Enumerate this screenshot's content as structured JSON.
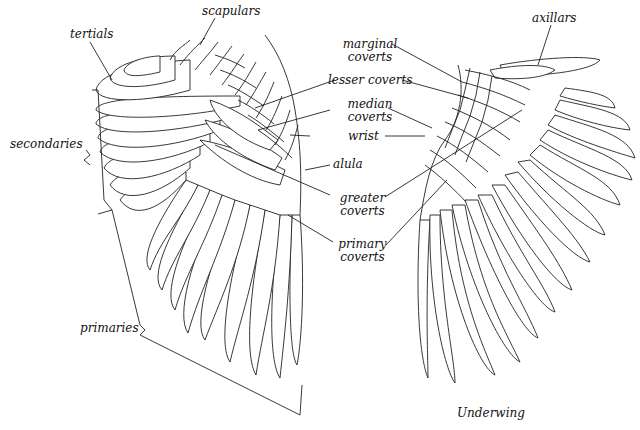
{
  "diagram": {
    "type": "labeled wing anatomy illustration",
    "views": [
      {
        "name": "upperwing",
        "caption": ""
      },
      {
        "name": "underwing",
        "caption": "Underwing"
      }
    ],
    "labels": {
      "scapulars": "scapulars",
      "tertials": "tertials",
      "secondaries": "secondaries",
      "primaries": "primaries",
      "axillars": "axillars",
      "marginal_coverts_1": "marginal",
      "marginal_coverts_2": "coverts",
      "lesser_coverts": "lesser coverts",
      "median_coverts_1": "median",
      "median_coverts_2": "coverts",
      "wrist": "wrist",
      "alula": "alula",
      "greater_coverts_1": "greater",
      "greater_coverts_2": "coverts",
      "primary_coverts_1": "primary",
      "primary_coverts_2": "coverts",
      "underwing_caption": "Underwing"
    },
    "line_color": "#222222",
    "background": "#ffffff"
  }
}
